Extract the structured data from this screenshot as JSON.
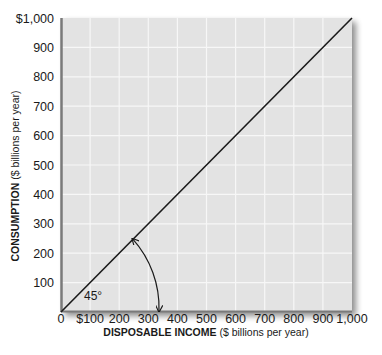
{
  "chart_data": {
    "type": "line",
    "title": "",
    "xlabel": "DISPOSABLE INCOME ($ billions per year)",
    "xlabel_bold": "DISPOSABLE INCOME",
    "xlabel_rest": " ($ billions per year)",
    "ylabel": "CONSUMPTION ($ billions per year)",
    "ylabel_bold": "CONSUMPTION",
    "ylabel_rest": " ($ billions per year)",
    "xlim": [
      0,
      1000
    ],
    "ylim": [
      0,
      1000
    ],
    "grid": true,
    "x_ticks": [
      0,
      100,
      200,
      300,
      400,
      500,
      600,
      700,
      800,
      900,
      1000
    ],
    "x_tick_labels": [
      "0",
      "$100",
      "200",
      "300",
      "400",
      "500",
      "600",
      "700",
      "800",
      "900",
      "1,000"
    ],
    "y_ticks": [
      100,
      200,
      300,
      400,
      500,
      600,
      700,
      800,
      900,
      1000
    ],
    "y_tick_labels": [
      "100",
      "200",
      "300",
      "400",
      "500",
      "600",
      "700",
      "800",
      "900",
      "$1,000"
    ],
    "series": [
      {
        "name": "45-degree line",
        "x": [
          0,
          1000
        ],
        "y": [
          0,
          1000
        ],
        "color": "#1a1a1a"
      }
    ],
    "annotations": [
      {
        "text": "45°",
        "type": "angle-arc",
        "x": 120,
        "y": 40
      }
    ],
    "legend": null
  },
  "style": {
    "plot_bg": "#e3e3e3",
    "grid_color": "#f7f7f7",
    "axis_color": "#7a7a7a",
    "line_color": "#1a1a1a",
    "shadow_color": "#9a9a9a"
  }
}
